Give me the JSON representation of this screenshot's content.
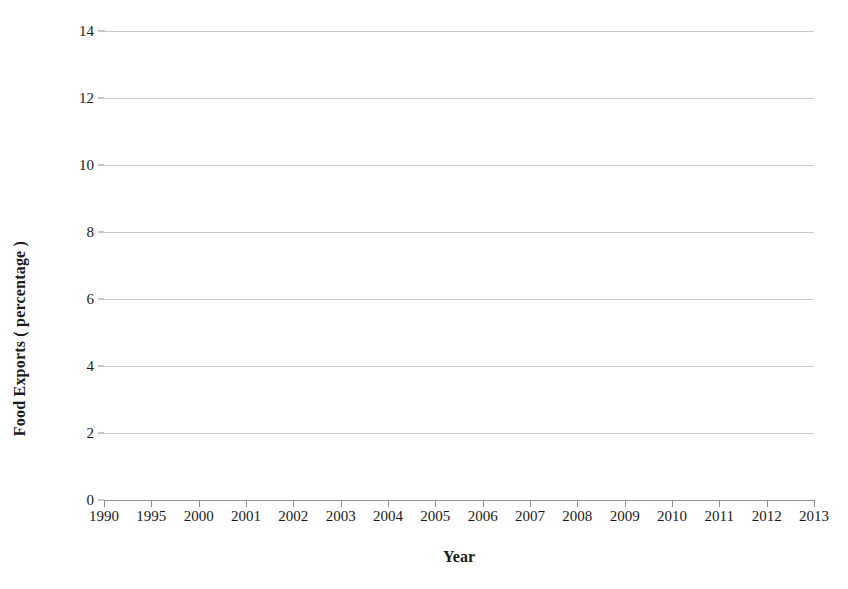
{
  "chart_data": {
    "type": "line",
    "title": "",
    "xlabel": "Year",
    "ylabel": "Food Exports ( percentage )",
    "categories": [
      "1990",
      "1995",
      "2000",
      "2001",
      "2002",
      "2003",
      "2004",
      "2005",
      "2006",
      "2007",
      "2008",
      "2009",
      "2010",
      "2011",
      "2012",
      "2013"
    ],
    "values": [
      1.6,
      4.4,
      6.65,
      5.45,
      7.55,
      8.3,
      11.25,
      12.3,
      13.8,
      11.1,
      8.45,
      10.05,
      11.1,
      7.05,
      8.35,
      8.35
    ],
    "yticks": [
      0,
      2,
      4,
      6,
      8,
      10,
      12,
      14
    ],
    "ylim": [
      0,
      14
    ],
    "grid": true,
    "legend": false,
    "series_color": "#7a7a7a",
    "grid_color": "#c8c8c8",
    "axis_color": "#8f8f8f",
    "marker": "diamond",
    "last_tick_clipped_text": "201"
  },
  "axis_titles": {
    "y": "Food Exports ( percentage )",
    "x": "Year"
  }
}
